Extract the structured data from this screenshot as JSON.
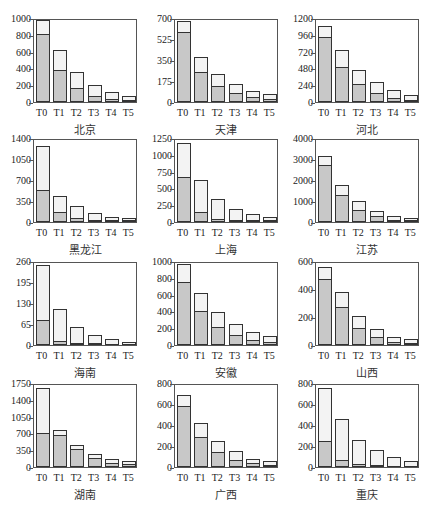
{
  "figure": {
    "caption": ""
  },
  "chart_data": [
    {
      "type": "bar",
      "stacked_overlay": true,
      "title": "北京",
      "categories": [
        "T0",
        "T1",
        "T2",
        "T3",
        "T4",
        "T5"
      ],
      "yticks": [
        0,
        200,
        400,
        600,
        800,
        1000
      ],
      "ylim": [
        0,
        1000
      ],
      "series": [
        {
          "name": "total",
          "values": [
            975,
            620,
            360,
            200,
            125,
            75
          ]
        },
        {
          "name": "part",
          "values": [
            810,
            380,
            170,
            75,
            35,
            15
          ]
        }
      ]
    },
    {
      "type": "bar",
      "stacked_overlay": true,
      "title": "天津",
      "categories": [
        "T0",
        "T1",
        "T2",
        "T3",
        "T4",
        "T5"
      ],
      "yticks": [
        0,
        175,
        350,
        525,
        700
      ],
      "ylim": [
        0,
        700
      ],
      "series": [
        {
          "name": "total",
          "values": [
            675,
            375,
            230,
            150,
            95,
            65
          ]
        },
        {
          "name": "part",
          "values": [
            580,
            250,
            130,
            75,
            40,
            25
          ]
        }
      ]
    },
    {
      "type": "bar",
      "stacked_overlay": true,
      "title": "河北",
      "categories": [
        "T0",
        "T1",
        "T2",
        "T3",
        "T4",
        "T5"
      ],
      "yticks": [
        0,
        240,
        480,
        720,
        960,
        1200
      ],
      "ylim": [
        0,
        1200
      ],
      "series": [
        {
          "name": "total",
          "values": [
            1090,
            740,
            460,
            290,
            170,
            100
          ]
        },
        {
          "name": "part",
          "values": [
            930,
            500,
            260,
            125,
            55,
            25
          ]
        }
      ]
    },
    {
      "type": "bar",
      "stacked_overlay": true,
      "title": "黑龙江",
      "categories": [
        "T0",
        "T1",
        "T2",
        "T3",
        "T4",
        "T5"
      ],
      "yticks": [
        0,
        350,
        700,
        1050,
        1400
      ],
      "ylim": [
        0,
        1400
      ],
      "series": [
        {
          "name": "total",
          "values": [
            1260,
            440,
            260,
            145,
            90,
            60
          ]
        },
        {
          "name": "part",
          "values": [
            540,
            170,
            65,
            25,
            10,
            5
          ]
        }
      ]
    },
    {
      "type": "bar",
      "stacked_overlay": true,
      "title": "上海",
      "categories": [
        "T0",
        "T1",
        "T2",
        "T3",
        "T4",
        "T5"
      ],
      "yticks": [
        0,
        250,
        500,
        750,
        1000,
        1250
      ],
      "ylim": [
        0,
        1250
      ],
      "series": [
        {
          "name": "total",
          "values": [
            1180,
            620,
            345,
            200,
            125,
            80
          ]
        },
        {
          "name": "part",
          "values": [
            670,
            150,
            50,
            20,
            10,
            5
          ]
        }
      ]
    },
    {
      "type": "bar",
      "stacked_overlay": true,
      "title": "江苏",
      "categories": [
        "T0",
        "T1",
        "T2",
        "T3",
        "T4",
        "T5"
      ],
      "yticks": [
        0,
        1000,
        2000,
        3000,
        4000
      ],
      "ylim": [
        0,
        4000
      ],
      "series": [
        {
          "name": "total",
          "values": [
            3150,
            1760,
            990,
            540,
            300,
            190
          ]
        },
        {
          "name": "part",
          "values": [
            2700,
            1280,
            580,
            270,
            100,
            40
          ]
        }
      ]
    },
    {
      "type": "bar",
      "stacked_overlay": true,
      "title": "海南",
      "categories": [
        "T0",
        "T1",
        "T2",
        "T3",
        "T4",
        "T5"
      ],
      "yticks": [
        0,
        65,
        130,
        195,
        260
      ],
      "ylim": [
        0,
        260
      ],
      "series": [
        {
          "name": "total",
          "values": [
            247,
            110,
            55,
            30,
            19,
            9
          ]
        },
        {
          "name": "part",
          "values": [
            77,
            12,
            4,
            3,
            0,
            0
          ]
        }
      ]
    },
    {
      "type": "bar",
      "stacked_overlay": true,
      "title": "安徽",
      "categories": [
        "T0",
        "T1",
        "T2",
        "T3",
        "T4",
        "T5"
      ],
      "yticks": [
        0,
        200,
        400,
        600,
        800,
        1000
      ],
      "ylim": [
        0,
        1000
      ],
      "series": [
        {
          "name": "total",
          "values": [
            960,
            615,
            390,
            255,
            160,
            105
          ]
        },
        {
          "name": "part",
          "values": [
            755,
            410,
            215,
            115,
            60,
            30
          ]
        }
      ]
    },
    {
      "type": "bar",
      "stacked_overlay": true,
      "title": "山西",
      "categories": [
        "T0",
        "T1",
        "T2",
        "T3",
        "T4",
        "T5"
      ],
      "yticks": [
        0,
        200,
        400,
        600
      ],
      "ylim": [
        0,
        600
      ],
      "series": [
        {
          "name": "total",
          "values": [
            560,
            380,
            205,
            115,
            60,
            40
          ]
        },
        {
          "name": "part",
          "values": [
            470,
            270,
            120,
            55,
            25,
            15
          ]
        }
      ]
    },
    {
      "type": "bar",
      "stacked_overlay": true,
      "title": "湖南",
      "categories": [
        "T0",
        "T1",
        "T2",
        "T3",
        "T4",
        "T5"
      ],
      "yticks": [
        0,
        350,
        700,
        1050,
        1400,
        1750
      ],
      "ylim": [
        0,
        1750
      ],
      "series": [
        {
          "name": "total",
          "values": [
            1650,
            780,
            450,
            280,
            170,
            120
          ]
        },
        {
          "name": "part",
          "values": [
            700,
            670,
            380,
            180,
            90,
            60
          ]
        }
      ]
    },
    {
      "type": "bar",
      "stacked_overlay": true,
      "title": "广西",
      "categories": [
        "T0",
        "T1",
        "T2",
        "T3",
        "T4",
        "T5"
      ],
      "yticks": [
        0,
        200,
        400,
        600,
        800
      ],
      "ylim": [
        0,
        800
      ],
      "series": [
        {
          "name": "total",
          "values": [
            690,
            420,
            250,
            150,
            80,
            55
          ]
        },
        {
          "name": "part",
          "values": [
            580,
            290,
            145,
            70,
            35,
            20
          ]
        }
      ]
    },
    {
      "type": "bar",
      "stacked_overlay": true,
      "title": "重庆",
      "categories": [
        "T0",
        "T1",
        "T2",
        "T3",
        "T4",
        "T5"
      ],
      "yticks": [
        0,
        200,
        400,
        600,
        800
      ],
      "ylim": [
        0,
        800
      ],
      "series": [
        {
          "name": "total",
          "values": [
            750,
            455,
            260,
            165,
            95,
            55
          ]
        },
        {
          "name": "part",
          "values": [
            250,
            65,
            30,
            15,
            0,
            0
          ]
        }
      ]
    }
  ]
}
